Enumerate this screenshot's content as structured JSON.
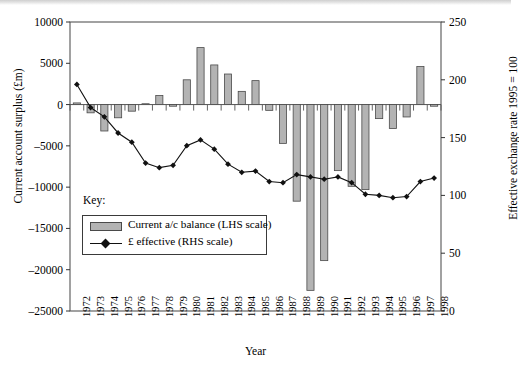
{
  "chart_data": {
    "type": "bar",
    "title": "",
    "xlabel": "Year",
    "ylabel": "Current account surplus (£m)",
    "y2label": "Effective exchange rate 1995 = 100",
    "ylim": [
      -25000,
      10000
    ],
    "y2lim": [
      0,
      250
    ],
    "yticks": [
      10000,
      5000,
      0,
      -5000,
      -10000,
      -15000,
      -20000,
      -25000
    ],
    "ytick_labels": [
      "10000",
      "5000",
      "0",
      "-5000",
      "-10000",
      "-15000",
      "-20000",
      "-25000"
    ],
    "y2ticks": [
      250,
      200,
      150,
      100,
      50,
      0
    ],
    "y2tick_labels": [
      "250",
      "200",
      "150",
      "100",
      "50",
      "0"
    ],
    "grid": false,
    "legend_position": "lower-left-inside",
    "legend_title": "Key:",
    "categories": [
      "1972",
      "1973",
      "1974",
      "1975",
      "1976",
      "1977",
      "1978",
      "1979",
      "1980",
      "1981",
      "1982",
      "1983",
      "1984",
      "1985",
      "1986",
      "1987",
      "1988",
      "1989",
      "1990",
      "1991",
      "1992",
      "1993",
      "1994",
      "1995",
      "1996",
      "1997",
      "1998"
    ],
    "series": [
      {
        "name": "Current a/c balance (LHS scale)",
        "legend_label": "Current a/c balance (LHS scale)",
        "kind": "bar",
        "axis": "left",
        "color": "#b3b3b3",
        "edge_color": "#4a4a4a",
        "values": [
          200,
          -1000,
          -3200,
          -1600,
          -800,
          100,
          1100,
          -200,
          3000,
          6900,
          4800,
          3700,
          1600,
          2900,
          -700,
          -4700,
          -11700,
          -22500,
          -18900,
          -8000,
          -9900,
          -10300,
          -1700,
          -2900,
          -1500,
          4600,
          -200
        ]
      },
      {
        "name": "£ effective (RHS scale)",
        "legend_label": "£ effective (RHS scale)",
        "kind": "line",
        "axis": "right",
        "color": "#111111",
        "marker": "diamond",
        "values": [
          196,
          176,
          168,
          154,
          146,
          128,
          124,
          126,
          143,
          148,
          140,
          127,
          120,
          121,
          112,
          111,
          118,
          116,
          114,
          116,
          111,
          101,
          100,
          98,
          99,
          112,
          115
        ]
      }
    ]
  }
}
